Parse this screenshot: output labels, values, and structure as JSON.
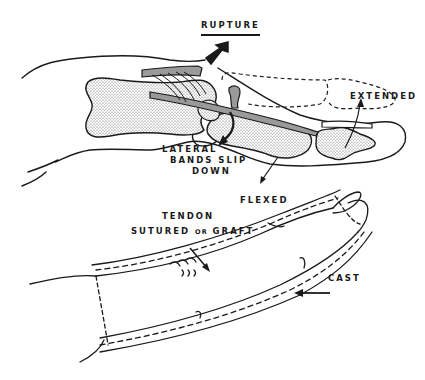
{
  "figure": {
    "labels": {
      "rupture": "RUPTURE",
      "extended": "EXTENDED",
      "lateral_bands_line1": "LATERAL",
      "lateral_bands_line2": "BANDS SLIP",
      "lateral_bands_line3": "DOWN",
      "flexed": "FLEXED",
      "tendon_line1": "TENDON",
      "tendon_line2_a": "SUTURED",
      "tendon_line2_or": "OR",
      "tendon_line2_b": "GRAFT",
      "cast": "CAST"
    },
    "colors": {
      "ink": "#1a1a1a",
      "tendon_fill": "#9a9a9a",
      "bone_fill": "#d8d8d8",
      "background": "#ffffff"
    }
  }
}
